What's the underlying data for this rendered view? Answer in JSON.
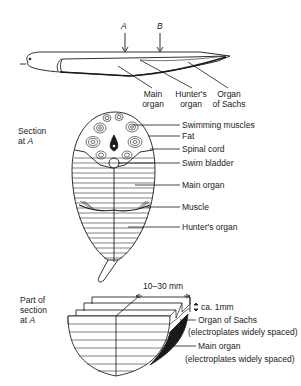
{
  "top_view": {
    "markers": [
      {
        "label": "A"
      },
      {
        "label": "B"
      }
    ],
    "labels": {
      "main_organ": [
        "Main",
        "organ"
      ],
      "hunters_organ": [
        "Hunter's",
        "organ"
      ],
      "organ_of_sachs": [
        "Organ",
        "of Sachs"
      ]
    }
  },
  "section_a": {
    "title": [
      "Section",
      "at"
    ],
    "title_marker": "A",
    "labels": [
      "Swimming muscles",
      "Fat",
      "Spinal cord",
      "Swim bladder",
      "Main organ",
      "Muscle",
      "Hunter's organ"
    ]
  },
  "part_section_a": {
    "title": [
      "Part of",
      "section",
      "at"
    ],
    "title_marker": "A",
    "width_dim": "10–30 mm",
    "thickness_dim": "ca. 1mm",
    "labels": {
      "organ_of_sachs": "Organ of Sachs",
      "organ_of_sachs_note": "(electroplates widely spaced)",
      "main_organ": "Main organ",
      "main_organ_note": "(electroplates widely spaced)"
    }
  },
  "colors": {
    "ink": "#1a1a1a",
    "background": "#ffffff"
  }
}
